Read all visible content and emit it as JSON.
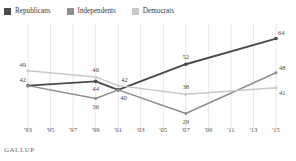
{
  "legend": {
    "items": [
      {
        "label": "Republicans",
        "color": "#4a4a4a",
        "key": "republicans"
      },
      {
        "label": "Independents",
        "color": "#8e8e8e",
        "key": "independents"
      },
      {
        "label": "Democrats",
        "color": "#c9c9c9",
        "key": "democrats"
      }
    ]
  },
  "source": {
    "label": "GALLUP"
  },
  "chart_data": {
    "type": "line",
    "title": "",
    "subtitle": "",
    "xlabel": "",
    "ylabel": "",
    "grid": "vertical",
    "legend_position": "top-left",
    "x_tick_labels": [
      "'93",
      "'95",
      "'97",
      "'99",
      "'01",
      "'03",
      "'05",
      "'07",
      "'09",
      "'11",
      "'13",
      "'15"
    ],
    "x_tick_values": [
      1993,
      1995,
      1997,
      1999,
      2001,
      2003,
      2005,
      2007,
      2009,
      2011,
      2013,
      2015
    ],
    "xlim": [
      1993,
      2015
    ],
    "ylim": [
      25,
      68
    ],
    "x": [
      1993,
      1999,
      2001,
      2007,
      2015
    ],
    "series": [
      {
        "name": "Republicans",
        "color": "#4a4a4a",
        "values": [
          42,
          44,
          40,
          52,
          64
        ],
        "point_labels": [
          "42",
          "44",
          "40",
          "52",
          "64"
        ]
      },
      {
        "name": "Independents",
        "color": "#8e8e8e",
        "values": [
          42,
          36,
          40,
          29,
          48
        ],
        "point_labels": [
          "",
          "36",
          "",
          "29",
          "48"
        ]
      },
      {
        "name": "Democrats",
        "color": "#c9c9c9",
        "values": [
          49,
          46,
          42,
          38,
          41
        ],
        "point_labels": [
          "49",
          "46",
          "42",
          "38",
          "41"
        ]
      }
    ]
  }
}
